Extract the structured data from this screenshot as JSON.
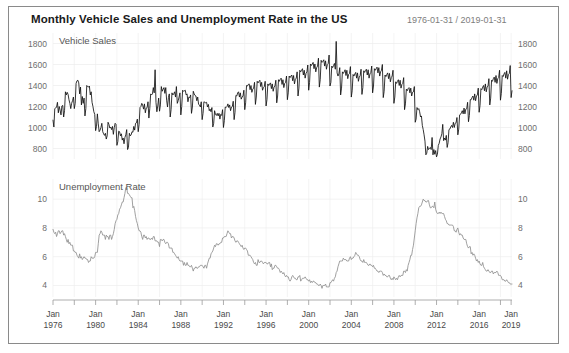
{
  "header": {
    "title": "Monthly Vehicle Sales and Unemployment Rate in the US",
    "date_range": "1976-01-31 / 2019-01-31"
  },
  "colors": {
    "sales_line": "#111111",
    "unemployment_line": "#8f8f8f",
    "grid": "#ededed",
    "axis": "#9a9a9a",
    "frame_border": "#8a8a8a",
    "background": "#ffffff",
    "title_text": "#1a1a1a",
    "range_text": "#7d7d7d"
  },
  "chart_data": {
    "type": "line",
    "title": "Monthly Vehicle Sales and Unemployment Rate in the US",
    "subtitle": "1976-01-31 / 2019-01-31",
    "grid": true,
    "legend_position": "inside-top-left-per-panel",
    "xlabel": "",
    "x_tick_labels": [
      "Jan\n1976",
      "Jan\n1980",
      "Jan\n1984",
      "Jan\n1988",
      "Jan\n1992",
      "Jan\n1996",
      "Jan\n2000",
      "Jan\n2004",
      "Jan\n2008",
      "Jan\n2012",
      "Jan\n2016",
      "Jan\n2019"
    ],
    "x_tick_years": [
      1976,
      1980,
      1984,
      1988,
      1992,
      1996,
      2000,
      2004,
      2008,
      2012,
      2016,
      2019
    ],
    "x_minor_tick_years": [
      1978,
      1982,
      1986,
      1990,
      1994,
      1998,
      2002,
      2006,
      2010,
      2014,
      2018
    ],
    "xlim": [
      1976.0,
      2019.083
    ],
    "panels": [
      {
        "name": "Vehicle Sales",
        "ylabel": "Vehicle Sales",
        "unit": "thousands of units (SAAR)",
        "ylim": [
          700,
          1900
        ],
        "y_ticks": [
          800,
          1000,
          1200,
          1400,
          1600,
          1800
        ],
        "axis_sides": [
          "left",
          "right"
        ],
        "series_name": "Vehicle Sales",
        "color": "#111111",
        "x_start": 1976.0,
        "x_step": 0.08333,
        "values": [
          1070,
          1005,
          1180,
          1185,
          1195,
          1240,
          1140,
          1200,
          1165,
          1120,
          1205,
          1210,
          1100,
          1160,
          1340,
          1310,
          1335,
          1315,
          1265,
          1230,
          1180,
          1230,
          1255,
          1290,
          1180,
          1230,
          1420,
          1445,
          1450,
          1425,
          1320,
          1385,
          1215,
          1295,
          1230,
          1280,
          1110,
          1180,
          1400,
          1390,
          1385,
          1395,
          1310,
          1340,
          1240,
          1200,
          1150,
          1125,
          970,
          1010,
          1130,
          1035,
          960,
          975,
          1000,
          1040,
          960,
          940,
          925,
          945,
          890,
          920,
          1050,
          1030,
          995,
          1005,
          980,
          1010,
          935,
          1000,
          1040,
          1030,
          830,
          865,
          965,
          960,
          920,
          940,
          880,
          900,
          845,
          905,
          930,
          980,
          790,
          810,
          945,
          920,
          930,
          960,
          955,
          1010,
          975,
          1040,
          1045,
          1080,
          960,
          1030,
          1190,
          1200,
          1230,
          1215,
          1175,
          1225,
          1140,
          1185,
          1190,
          1245,
          1090,
          1180,
          1320,
          1310,
          1320,
          1380,
          1330,
          1550,
          1240,
          1150,
          1205,
          1280,
          1155,
          1215,
          1390,
          1345,
          1365,
          1380,
          1325,
          1380,
          1260,
          1195,
          1285,
          1320,
          1100,
          1170,
          1330,
          1310,
          1320,
          1340,
          1290,
          1390,
          1230,
          1255,
          1290,
          1330,
          1120,
          1200,
          1355,
          1345,
          1350,
          1355,
          1310,
          1320,
          1245,
          1290,
          1285,
          1310,
          1135,
          1195,
          1345,
          1320,
          1305,
          1300,
          1255,
          1290,
          1220,
          1215,
          1195,
          1245,
          1075,
          1135,
          1245,
          1240,
          1235,
          1240,
          1195,
          1220,
          1160,
          1175,
          1150,
          1190,
          1005,
          1040,
          1160,
          1125,
          1115,
          1135,
          1110,
          1135,
          1080,
          1125,
          1115,
          1170,
          1000,
          1065,
          1195,
          1190,
          1200,
          1225,
          1190,
          1215,
          1160,
          1195,
          1200,
          1250,
          1075,
          1145,
          1305,
          1300,
          1330,
          1340,
          1290,
          1330,
          1270,
          1290,
          1300,
          1355,
          1170,
          1235,
          1400,
          1395,
          1410,
          1415,
          1360,
          1400,
          1335,
          1365,
          1375,
          1430,
          1220,
          1290,
          1440,
          1425,
          1440,
          1450,
          1390,
          1430,
          1355,
          1380,
          1390,
          1440,
          1205,
          1265,
          1415,
          1400,
          1415,
          1425,
          1370,
          1415,
          1345,
          1385,
          1395,
          1450,
          1235,
          1300,
          1455,
          1440,
          1460,
          1470,
          1410,
          1455,
          1380,
          1420,
          1430,
          1490,
          1265,
          1330,
          1490,
          1475,
          1490,
          1500,
          1445,
          1495,
          1415,
          1460,
          1470,
          1530,
          1300,
          1375,
          1545,
          1530,
          1545,
          1560,
          1500,
          1545,
          1470,
          1515,
          1530,
          1595,
          1355,
          1430,
          1605,
          1590,
          1605,
          1620,
          1560,
          1605,
          1530,
          1570,
          1585,
          1660,
          1385,
          1455,
          1640,
          1620,
          1630,
          1645,
          1585,
          1635,
          1555,
          1600,
          1610,
          1690,
          1395,
          1430,
          1585,
          1570,
          1590,
          1610,
          1555,
          1820,
          1520,
          1490,
          1510,
          1570,
          1310,
          1375,
          1530,
          1515,
          1530,
          1550,
          1495,
          1545,
          1465,
          1505,
          1515,
          1580,
          1290,
          1350,
          1505,
          1490,
          1510,
          1525,
          1470,
          1520,
          1440,
          1480,
          1495,
          1555,
          1315,
          1380,
          1540,
          1525,
          1545,
          1555,
          1500,
          1550,
          1470,
          1510,
          1525,
          1585,
          1330,
          1395,
          1560,
          1545,
          1560,
          1575,
          1520,
          1570,
          1490,
          1530,
          1545,
          1600,
          1285,
          1345,
          1500,
          1485,
          1505,
          1520,
          1465,
          1515,
          1435,
          1475,
          1490,
          1545,
          1230,
          1290,
          1435,
          1420,
          1440,
          1455,
          1400,
          1450,
          1375,
          1410,
          1420,
          1475,
          1170,
          1225,
          1365,
          1350,
          1370,
          1380,
          1330,
          1375,
          1300,
          1335,
          1340,
          1390,
          1050,
          1080,
          1190,
          1170,
          1180,
          1150,
          1100,
          1110,
          1020,
          980,
          930,
          870,
          740,
          755,
          820,
          790,
          800,
          810,
          790,
          905,
          740,
          790,
          745,
          780,
          720,
          745,
          830,
          850,
          890,
          910,
          940,
          1030,
          875,
          900,
          880,
          925,
          810,
          855,
          980,
          985,
          1005,
          1020,
          1000,
          1050,
          1000,
          1040,
          1045,
          1095,
          930,
          985,
          1120,
          1125,
          1140,
          1160,
          1130,
          1185,
          1130,
          1175,
          1180,
          1240,
          1055,
          1115,
          1265,
          1265,
          1285,
          1300,
          1260,
          1320,
          1255,
          1300,
          1310,
          1375,
          1145,
          1210,
          1370,
          1360,
          1385,
          1400,
          1350,
          1415,
          1340,
          1385,
          1395,
          1465,
          1215,
          1280,
          1450,
          1440,
          1465,
          1480,
          1430,
          1495,
          1420,
          1465,
          1475,
          1545,
          1260,
          1325,
          1495,
          1485,
          1510,
          1525,
          1470,
          1540,
          1460,
          1505,
          1515,
          1590,
          1285,
          1350,
          1525,
          1510,
          1535,
          1555,
          1495,
          1570,
          1485,
          1530,
          1540,
          1615,
          1295,
          1360,
          1535,
          1525,
          1550,
          1570,
          1510,
          1580,
          1495,
          1545,
          1555,
          1630,
          1305,
          1370,
          1545,
          1535,
          1560,
          1580,
          1520,
          1595,
          1505,
          1555,
          1565,
          1645,
          1310
        ]
      },
      {
        "name": "Unemployment Rate",
        "ylabel": "Unemployment Rate",
        "unit": "percent",
        "ylim": [
          3.2,
          11.4
        ],
        "y_ticks": [
          4,
          6,
          8,
          10
        ],
        "axis_sides": [
          "left",
          "right"
        ],
        "series_name": "Unemployment Rate",
        "color": "#8f8f8f",
        "x_start": 1976.0,
        "x_step": 0.08333,
        "values": [
          7.9,
          7.7,
          7.6,
          7.7,
          7.4,
          7.6,
          7.8,
          7.8,
          7.6,
          7.7,
          7.8,
          7.8,
          7.5,
          7.6,
          7.4,
          7.2,
          7.0,
          7.2,
          6.9,
          7.0,
          6.8,
          6.8,
          6.8,
          6.4,
          6.4,
          6.3,
          6.3,
          6.1,
          6.0,
          5.9,
          6.2,
          5.9,
          6.0,
          5.8,
          5.9,
          6.0,
          5.9,
          5.9,
          5.8,
          5.8,
          5.6,
          5.7,
          5.7,
          6.0,
          5.9,
          5.9,
          5.9,
          6.0,
          6.3,
          6.3,
          6.3,
          6.9,
          7.5,
          7.6,
          7.8,
          7.7,
          7.5,
          7.5,
          7.5,
          7.2,
          7.5,
          7.4,
          7.4,
          7.2,
          7.5,
          7.5,
          7.2,
          7.4,
          7.6,
          7.9,
          8.3,
          8.5,
          8.6,
          8.9,
          9.0,
          9.3,
          9.4,
          9.6,
          9.8,
          9.8,
          10.1,
          10.4,
          10.8,
          10.8,
          10.4,
          10.4,
          10.3,
          10.2,
          10.1,
          10.1,
          9.4,
          9.5,
          9.2,
          8.8,
          8.5,
          8.3,
          8.0,
          7.8,
          7.8,
          7.7,
          7.4,
          7.2,
          7.5,
          7.5,
          7.3,
          7.4,
          7.2,
          7.3,
          7.3,
          7.2,
          7.2,
          7.3,
          7.2,
          7.4,
          7.4,
          7.1,
          7.1,
          7.1,
          7.0,
          7.0,
          6.7,
          7.2,
          7.2,
          7.1,
          7.2,
          7.2,
          7.0,
          6.9,
          7.0,
          7.0,
          6.9,
          6.6,
          6.6,
          6.6,
          6.6,
          6.3,
          6.3,
          6.2,
          6.1,
          6.0,
          5.9,
          6.0,
          5.8,
          5.7,
          5.7,
          5.7,
          5.7,
          5.4,
          5.6,
          5.4,
          5.4,
          5.6,
          5.4,
          5.4,
          5.3,
          5.3,
          5.4,
          5.2,
          5.0,
          5.2,
          5.2,
          5.3,
          5.2,
          5.2,
          5.3,
          5.3,
          5.4,
          5.4,
          5.4,
          5.3,
          5.2,
          5.4,
          5.4,
          5.2,
          5.5,
          5.7,
          5.9,
          5.9,
          6.2,
          6.3,
          6.4,
          6.6,
          6.8,
          6.7,
          6.9,
          6.9,
          6.8,
          6.9,
          6.9,
          7.0,
          7.0,
          7.3,
          7.3,
          7.4,
          7.4,
          7.4,
          7.6,
          7.8,
          7.7,
          7.6,
          7.6,
          7.3,
          7.4,
          7.4,
          7.3,
          7.1,
          7.0,
          7.1,
          7.1,
          7.0,
          6.9,
          6.8,
          6.7,
          6.8,
          6.6,
          6.5,
          6.6,
          6.6,
          6.5,
          6.4,
          6.1,
          6.1,
          6.1,
          6.0,
          5.9,
          5.8,
          5.6,
          5.5,
          5.6,
          5.4,
          5.4,
          5.8,
          5.6,
          5.6,
          5.7,
          5.7,
          5.6,
          5.5,
          5.6,
          5.6,
          5.6,
          5.5,
          5.5,
          5.6,
          5.6,
          5.3,
          5.5,
          5.1,
          5.2,
          5.2,
          5.4,
          5.4,
          5.3,
          5.2,
          5.2,
          5.1,
          4.9,
          5.0,
          4.9,
          4.8,
          4.9,
          4.7,
          4.6,
          4.7,
          4.6,
          4.6,
          4.4,
          4.3,
          4.4,
          4.6,
          4.7,
          4.6,
          4.5,
          4.5,
          4.4,
          4.4,
          4.6,
          4.6,
          4.7,
          4.3,
          4.4,
          4.5,
          4.5,
          4.5,
          4.6,
          4.5,
          4.4,
          4.4,
          4.3,
          4.4,
          4.2,
          4.3,
          4.2,
          4.3,
          4.3,
          4.2,
          4.2,
          4.1,
          4.1,
          4.0,
          4.0,
          4.1,
          4.0,
          3.8,
          4.0,
          4.0,
          4.0,
          4.1,
          3.9,
          3.9,
          3.9,
          3.9,
          4.2,
          4.2,
          4.3,
          4.4,
          4.3,
          4.5,
          4.6,
          4.9,
          5.0,
          5.3,
          5.5,
          5.7,
          5.7,
          5.7,
          5.7,
          5.9,
          5.8,
          5.8,
          5.8,
          5.7,
          5.7,
          5.7,
          5.9,
          6.0,
          5.8,
          5.9,
          5.9,
          6.0,
          6.1,
          6.3,
          6.2,
          6.1,
          6.1,
          6.0,
          5.8,
          5.7,
          5.7,
          5.6,
          5.8,
          5.6,
          5.6,
          5.6,
          5.5,
          5.4,
          5.4,
          5.5,
          5.4,
          5.4,
          5.3,
          5.4,
          5.2,
          5.2,
          5.1,
          5.0,
          5.0,
          4.9,
          5.0,
          5.0,
          5.0,
          4.9,
          4.7,
          4.8,
          4.7,
          4.7,
          4.6,
          4.6,
          4.7,
          4.7,
          4.5,
          4.4,
          4.5,
          4.4,
          4.6,
          4.5,
          4.4,
          4.5,
          4.4,
          4.6,
          4.7,
          4.6,
          4.7,
          4.7,
          4.7,
          5.0,
          5.0,
          4.9,
          5.1,
          5.0,
          5.4,
          5.6,
          5.8,
          6.1,
          6.1,
          6.5,
          6.8,
          7.3,
          7.8,
          8.3,
          8.7,
          9.0,
          9.4,
          9.5,
          9.5,
          9.6,
          9.8,
          10.0,
          9.9,
          9.9,
          9.8,
          9.8,
          9.9,
          9.9,
          9.6,
          9.4,
          9.4,
          9.5,
          9.5,
          9.4,
          9.8,
          9.3,
          9.1,
          9.0,
          9.0,
          9.1,
          9.0,
          9.1,
          9.0,
          9.0,
          9.0,
          8.8,
          8.6,
          8.5,
          8.3,
          8.3,
          8.2,
          8.2,
          8.2,
          8.2,
          8.2,
          8.1,
          7.8,
          7.8,
          7.7,
          7.9,
          8.0,
          7.7,
          7.5,
          7.6,
          7.5,
          7.5,
          7.3,
          7.2,
          7.2,
          7.2,
          6.9,
          6.7,
          6.6,
          6.7,
          6.7,
          6.2,
          6.3,
          6.1,
          6.2,
          6.1,
          5.9,
          5.7,
          5.8,
          5.6,
          5.7,
          5.5,
          5.4,
          5.4,
          5.6,
          5.3,
          5.2,
          5.1,
          5.0,
          5.0,
          5.1,
          5.0,
          4.9,
          4.9,
          5.0,
          5.0,
          4.8,
          4.9,
          4.9,
          4.9,
          5.0,
          4.9,
          4.7,
          4.7,
          4.7,
          4.6,
          4.4,
          4.4,
          4.4,
          4.3,
          4.3,
          4.4,
          4.3,
          4.2,
          4.2,
          4.1,
          4.1,
          4.1,
          4.0,
          3.9,
          3.8,
          4.0,
          3.9,
          3.8,
          3.7,
          3.8,
          3.7,
          3.9,
          4.0
        ]
      }
    ]
  }
}
